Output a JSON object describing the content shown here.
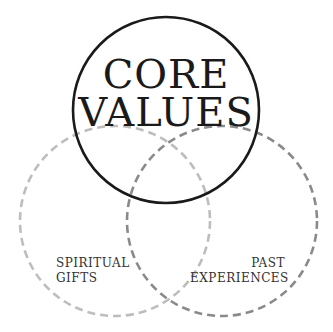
{
  "diagram": {
    "type": "venn",
    "circles": [
      {
        "id": "core-values",
        "label_lines": [
          "CORE",
          "VALUES"
        ],
        "cx": 166,
        "cy": 110,
        "r": 93,
        "stroke": "#1a1a1a",
        "style": "solid"
      },
      {
        "id": "spiritual-gifts",
        "label_lines": [
          "SPIRITUAL",
          "GIFTS"
        ],
        "cx": 115,
        "cy": 221,
        "r": 95,
        "stroke": "#bdbdbd",
        "style": "dashed"
      },
      {
        "id": "past-experiences",
        "label_lines": [
          "PAST",
          "EXPERIENCES"
        ],
        "cx": 222,
        "cy": 221,
        "r": 95,
        "stroke": "#8a8a8a",
        "style": "dashed"
      }
    ]
  },
  "labels": {
    "core_line1": "CORE",
    "core_line2": "VALUES",
    "left_line1": "SPIRITUAL",
    "left_line2": "GIFTS",
    "right_line1": "PAST",
    "right_line2": "EXPERIENCES"
  }
}
